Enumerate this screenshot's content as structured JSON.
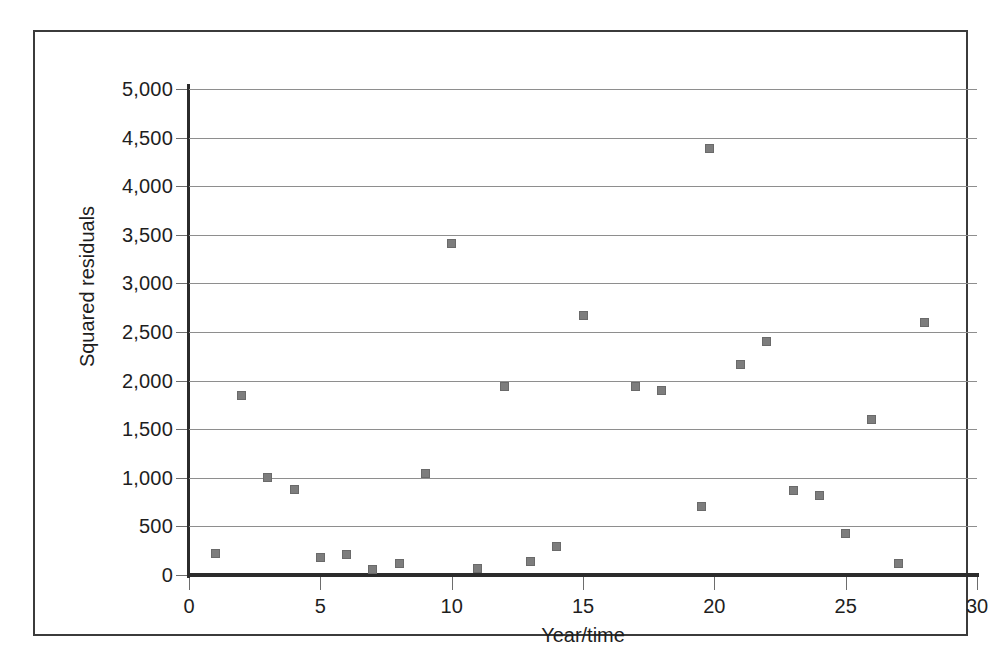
{
  "chart_data": {
    "type": "scatter",
    "title": "",
    "xlabel": "Year/time",
    "ylabel": "Squared residuals",
    "xlim": [
      0,
      30
    ],
    "ylim": [
      0,
      5000
    ],
    "grid": true,
    "legend": null,
    "marker_color": "#7d7d7d",
    "marker_shape": "square",
    "xticks": [
      0,
      5,
      10,
      15,
      20,
      25,
      30
    ],
    "xtick_labels": [
      "0",
      "5",
      "10",
      "15",
      "20",
      "25",
      "30"
    ],
    "yticks": [
      0,
      500,
      1000,
      1500,
      2000,
      2500,
      3000,
      3500,
      4000,
      4500,
      5000
    ],
    "ytick_labels": [
      "0",
      "500",
      "1,000",
      "1,500",
      "2,000",
      "2,500",
      "3,000",
      "3,500",
      "4,000",
      "4,500",
      "5,000"
    ],
    "x": [
      1,
      2,
      3,
      4,
      5,
      6,
      7,
      8,
      9,
      10,
      11,
      12,
      13,
      14,
      15,
      17,
      18,
      19.5,
      19.8,
      21,
      22,
      23,
      24,
      25,
      26,
      27,
      28
    ],
    "y": [
      225,
      1850,
      1000,
      880,
      175,
      215,
      60,
      115,
      1040,
      3415,
      70,
      1935,
      135,
      295,
      2670,
      1935,
      1900,
      700,
      4390,
      2170,
      2400,
      865,
      815,
      430,
      1595,
      120,
      2600
    ],
    "points": [
      {
        "x": 1,
        "y": 225
      },
      {
        "x": 2,
        "y": 1850
      },
      {
        "x": 3,
        "y": 1000
      },
      {
        "x": 4,
        "y": 880
      },
      {
        "x": 5,
        "y": 175
      },
      {
        "x": 6,
        "y": 215
      },
      {
        "x": 7,
        "y": 60
      },
      {
        "x": 8,
        "y": 115
      },
      {
        "x": 9,
        "y": 1040
      },
      {
        "x": 10,
        "y": 3415
      },
      {
        "x": 11,
        "y": 70
      },
      {
        "x": 12,
        "y": 1935
      },
      {
        "x": 13,
        "y": 135
      },
      {
        "x": 14,
        "y": 295
      },
      {
        "x": 15,
        "y": 2670
      },
      {
        "x": 17,
        "y": 1935
      },
      {
        "x": 18,
        "y": 1900
      },
      {
        "x": 19.5,
        "y": 700
      },
      {
        "x": 19.8,
        "y": 4390
      },
      {
        "x": 21,
        "y": 2170
      },
      {
        "x": 22,
        "y": 2400
      },
      {
        "x": 23,
        "y": 865
      },
      {
        "x": 24,
        "y": 815
      },
      {
        "x": 25,
        "y": 430
      },
      {
        "x": 26,
        "y": 1595
      },
      {
        "x": 27,
        "y": 120
      },
      {
        "x": 28,
        "y": 2600
      }
    ]
  }
}
